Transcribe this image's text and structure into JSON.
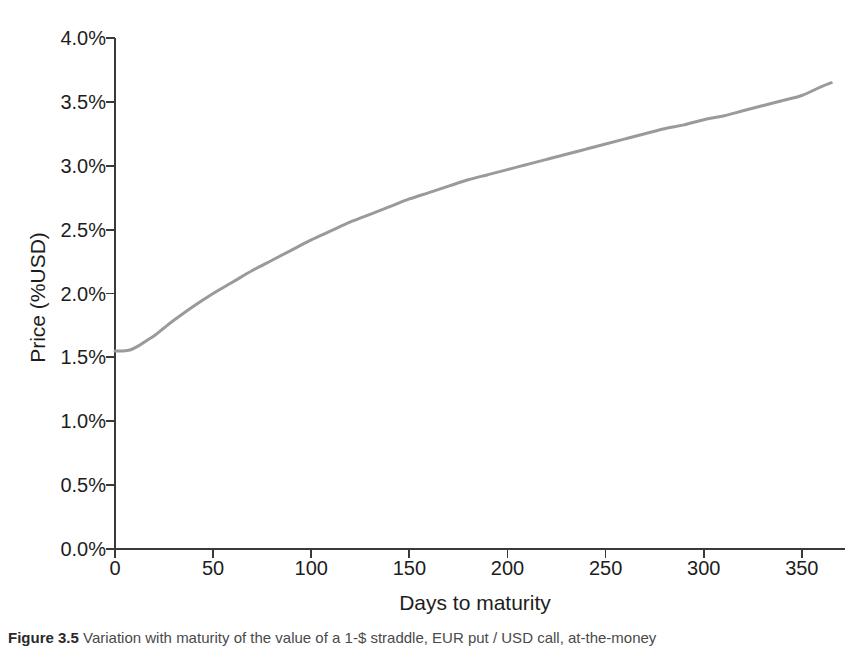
{
  "chart_data": {
    "type": "line",
    "title": "",
    "xlabel": "Days to maturity",
    "ylabel": "Price (%USD)",
    "xlim": [
      0,
      372
    ],
    "ylim": [
      0,
      4.0
    ],
    "grid": false,
    "legend": null,
    "xticks": [
      0,
      50,
      100,
      150,
      200,
      250,
      300,
      350
    ],
    "xtick_labels": [
      "0",
      "50",
      "100",
      "150",
      "200",
      "250",
      "300",
      "350"
    ],
    "yticks": [
      0.0,
      0.5,
      1.0,
      1.5,
      2.0,
      2.5,
      3.0,
      3.5,
      4.0
    ],
    "ytick_labels": [
      "0.0%",
      "0.5%",
      "1.0%",
      "1.5%",
      "2.0%",
      "2.5%",
      "3.0%",
      "3.5%",
      "4.0%"
    ],
    "series": [
      {
        "name": "Straddle price",
        "color": "#9a9a9a",
        "line_width": 3,
        "x": [
          0,
          4,
          8,
          12,
          16,
          20,
          25,
          30,
          40,
          50,
          60,
          70,
          80,
          90,
          100,
          110,
          120,
          130,
          140,
          150,
          160,
          170,
          180,
          190,
          200,
          210,
          220,
          230,
          240,
          250,
          260,
          270,
          280,
          290,
          300,
          310,
          320,
          330,
          340,
          350,
          360,
          365
        ],
        "y": [
          1.55,
          1.55,
          1.56,
          1.59,
          1.63,
          1.67,
          1.73,
          1.79,
          1.9,
          2.0,
          2.09,
          2.18,
          2.26,
          2.34,
          2.42,
          2.49,
          2.56,
          2.62,
          2.68,
          2.74,
          2.79,
          2.84,
          2.89,
          2.93,
          2.97,
          3.01,
          3.05,
          3.09,
          3.13,
          3.17,
          3.21,
          3.25,
          3.29,
          3.32,
          3.36,
          3.39,
          3.43,
          3.47,
          3.51,
          3.55,
          3.62,
          3.65
        ]
      }
    ],
    "annotations": []
  },
  "axes": {
    "y_title": "Price (%USD)",
    "x_title": "Days to maturity"
  },
  "caption": {
    "prefix": "Figure 3.5",
    "text": "Variation with maturity of the value of a 1-$ straddle, EUR put / USD call, at-the-money"
  },
  "colors": {
    "line": "#9a9a9a",
    "axis": "#3a3a3a",
    "text": "#1d1d1d",
    "background": "#ffffff"
  }
}
